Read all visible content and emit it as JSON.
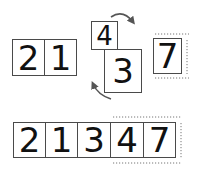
{
  "diagram": {
    "top_row": {
      "left_group": [
        "2",
        "1"
      ],
      "swapping_pair": {
        "upper": "4",
        "lower": "3"
      },
      "highlighted": "7"
    },
    "bottom_row": [
      "2",
      "1",
      "3",
      "4",
      "7"
    ],
    "highlighted_bottom_index": 4,
    "arrows": [
      "clockwise-arrow-top",
      "counterclockwise-arrow-bottom"
    ],
    "colors": {
      "border": "#4a4a4a",
      "text": "#111111",
      "arrow": "#555555",
      "glow": "#777777"
    }
  }
}
